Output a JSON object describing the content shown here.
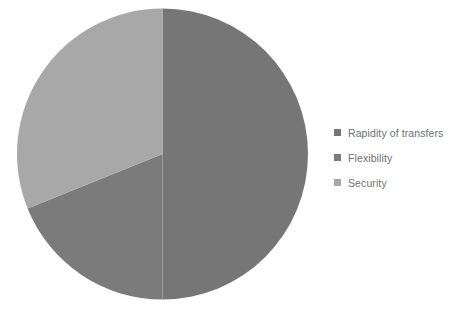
{
  "chart_data": {
    "type": "pie",
    "title": "",
    "categories": [
      "Rapidity of transfers",
      "Flexibility",
      "Security"
    ],
    "values": [
      50,
      19,
      31
    ],
    "unit": "%",
    "colors": [
      "#767676",
      "#7b7b7b",
      "#a8a8a8"
    ],
    "start_angle": 0,
    "direction": "clockwise",
    "legend_position": "right",
    "grid": false,
    "data_labels": false,
    "slices": [
      {
        "label": "Rapidity of transfers",
        "value": 50,
        "color": "#767676",
        "start_deg": 0,
        "end_deg": 180
      },
      {
        "label": "Flexibility",
        "value": 19,
        "color": "#7b7b7b",
        "start_deg": 180,
        "end_deg": 248
      },
      {
        "label": "Security",
        "value": 31,
        "color": "#a8a8a8",
        "start_deg": 248,
        "end_deg": 360
      }
    ]
  },
  "legend": {
    "items": [
      {
        "label": "Rapidity of transfers",
        "color": "#767676"
      },
      {
        "label": "Flexibility",
        "color": "#7b7b7b"
      },
      {
        "label": "Security",
        "color": "#a8a8a8"
      }
    ]
  }
}
